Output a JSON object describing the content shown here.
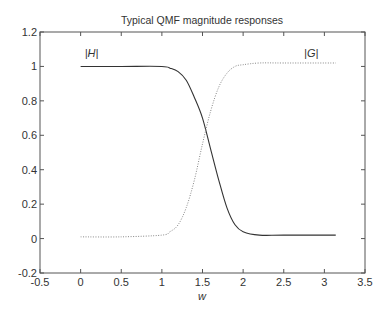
{
  "chart_data": {
    "type": "line",
    "title": "Typical QMF magnitude responses",
    "xlabel": "w",
    "ylabel": "",
    "xlim": [
      -0.5,
      3.5
    ],
    "ylim": [
      -0.2,
      1.2
    ],
    "xticks": [
      "-0.5",
      "0",
      "0.5",
      "1",
      "1.5",
      "2",
      "2.5",
      "3",
      "3.5"
    ],
    "yticks": [
      "-0.2",
      "0",
      "0.2",
      "0.4",
      "0.6",
      "0.8",
      "1",
      "1.2"
    ],
    "grid": false,
    "legend": "none",
    "annotations": [
      {
        "text": "|H|",
        "x": 0.05,
        "y": 1.08
      },
      {
        "text": "|G|",
        "x": 2.75,
        "y": 1.08
      }
    ],
    "series": [
      {
        "name": "|H|",
        "style": "solid",
        "color": "#333333",
        "x": [
          0,
          0.5,
          1.0,
          1.1,
          1.2,
          1.3,
          1.4,
          1.5,
          1.6,
          1.7,
          1.8,
          1.9,
          2.0,
          2.2,
          2.5,
          3.14
        ],
        "values": [
          1.0,
          1.0,
          1.0,
          0.99,
          0.97,
          0.92,
          0.82,
          0.7,
          0.52,
          0.34,
          0.18,
          0.08,
          0.04,
          0.02,
          0.02,
          0.02
        ]
      },
      {
        "name": "|G|",
        "style": "dotted",
        "color": "#888888",
        "x": [
          0,
          0.5,
          1.0,
          1.1,
          1.2,
          1.3,
          1.4,
          1.5,
          1.6,
          1.7,
          1.8,
          1.9,
          2.0,
          2.2,
          2.5,
          3.14
        ],
        "values": [
          0.01,
          0.01,
          0.02,
          0.04,
          0.08,
          0.18,
          0.34,
          0.55,
          0.74,
          0.88,
          0.96,
          1.0,
          1.01,
          1.02,
          1.02,
          1.02
        ]
      }
    ]
  }
}
